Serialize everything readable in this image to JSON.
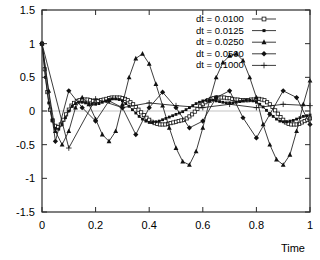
{
  "chart_data": {
    "type": "line",
    "title": "",
    "xlabel": "Time",
    "ylabel": "",
    "xlim": [
      0,
      1
    ],
    "ylim": [
      -1.5,
      1.5
    ],
    "grid": false,
    "legend_position": "top-right",
    "xticks": [
      "0",
      "0.2",
      "0.4",
      "0.6",
      "0.8",
      "1"
    ],
    "xtick_values": [
      0,
      0.2,
      0.4,
      0.6,
      0.8,
      1
    ],
    "yticks": [
      "1.5",
      "1",
      "0.5",
      "0",
      "-0.5",
      "-1",
      "-1.5"
    ],
    "ytick_values": [
      1.5,
      1,
      0.5,
      0,
      -0.5,
      -1,
      -1.5
    ],
    "series": [
      {
        "name": "dt = 0.0100",
        "marker": "open-square",
        "x": [
          0,
          0.01,
          0.02,
          0.03,
          0.04,
          0.05,
          0.06,
          0.07,
          0.08,
          0.09,
          0.1,
          0.11,
          0.12,
          0.13,
          0.14,
          0.15,
          0.16,
          0.17,
          0.18,
          0.19,
          0.2,
          0.21,
          0.22,
          0.23,
          0.24,
          0.25,
          0.26,
          0.27,
          0.28,
          0.29,
          0.3,
          0.31,
          0.32,
          0.33,
          0.34,
          0.35,
          0.36,
          0.37,
          0.38,
          0.39,
          0.4,
          0.41,
          0.42,
          0.43,
          0.44,
          0.45,
          0.46,
          0.47,
          0.48,
          0.49,
          0.5,
          0.51,
          0.52,
          0.53,
          0.54,
          0.55,
          0.56,
          0.57,
          0.58,
          0.59,
          0.6,
          0.61,
          0.62,
          0.63,
          0.64,
          0.65,
          0.66,
          0.67,
          0.68,
          0.69,
          0.7,
          0.71,
          0.72,
          0.73,
          0.74,
          0.75,
          0.76,
          0.77,
          0.78,
          0.79,
          0.8,
          0.81,
          0.82,
          0.83,
          0.84,
          0.85,
          0.86,
          0.87,
          0.88,
          0.89,
          0.9,
          0.91,
          0.92,
          0.93,
          0.94,
          0.95,
          0.96,
          0.97,
          0.98,
          0.99,
          1.0
        ],
        "y": [
          1.0,
          0.62,
          0.28,
          0.02,
          -0.14,
          -0.22,
          -0.24,
          -0.2,
          -0.13,
          -0.05,
          0.02,
          0.08,
          0.12,
          0.15,
          0.16,
          0.17,
          0.17,
          0.17,
          0.16,
          0.15,
          0.15,
          0.15,
          0.16,
          0.17,
          0.18,
          0.19,
          0.2,
          0.2,
          0.2,
          0.2,
          0.19,
          0.18,
          0.16,
          0.13,
          0.1,
          0.06,
          0.02,
          -0.02,
          -0.06,
          -0.1,
          -0.13,
          -0.16,
          -0.18,
          -0.19,
          -0.2,
          -0.2,
          -0.2,
          -0.19,
          -0.18,
          -0.17,
          -0.16,
          -0.15,
          -0.14,
          -0.13,
          -0.11,
          -0.08,
          -0.05,
          -0.01,
          0.03,
          0.07,
          0.1,
          0.13,
          0.16,
          0.18,
          0.19,
          0.2,
          0.2,
          0.2,
          0.2,
          0.19,
          0.19,
          0.18,
          0.17,
          0.17,
          0.16,
          0.16,
          0.16,
          0.16,
          0.17,
          0.17,
          0.18,
          0.18,
          0.17,
          0.16,
          0.13,
          0.1,
          0.06,
          0.01,
          -0.04,
          -0.09,
          -0.13,
          -0.17,
          -0.19,
          -0.2,
          -0.2,
          -0.2,
          -0.19,
          -0.17,
          -0.15,
          -0.13,
          -0.11
        ]
      },
      {
        "name": "dt = 0.0125",
        "marker": "filled-square",
        "x": [
          0,
          0.0125,
          0.025,
          0.0375,
          0.05,
          0.0625,
          0.075,
          0.0875,
          0.1,
          0.1125,
          0.125,
          0.1375,
          0.15,
          0.1625,
          0.175,
          0.1875,
          0.2,
          0.2125,
          0.225,
          0.2375,
          0.25,
          0.2625,
          0.275,
          0.2875,
          0.3,
          0.3125,
          0.325,
          0.3375,
          0.35,
          0.3625,
          0.375,
          0.3875,
          0.4,
          0.4125,
          0.425,
          0.4375,
          0.45,
          0.4625,
          0.475,
          0.4875,
          0.5,
          0.5125,
          0.525,
          0.5375,
          0.55,
          0.5625,
          0.575,
          0.5875,
          0.6,
          0.6125,
          0.625,
          0.6375,
          0.65,
          0.6625,
          0.675,
          0.6875,
          0.7,
          0.7125,
          0.725,
          0.7375,
          0.75,
          0.7625,
          0.775,
          0.7875,
          0.8,
          0.8125,
          0.825,
          0.8375,
          0.85,
          0.8625,
          0.875,
          0.8875,
          0.9,
          0.9125,
          0.925,
          0.9375,
          0.95,
          0.9625,
          0.975,
          0.9875,
          1.0
        ],
        "y": [
          1.0,
          0.5,
          0.12,
          -0.14,
          -0.26,
          -0.27,
          -0.2,
          -0.1,
          0.0,
          0.07,
          0.11,
          0.13,
          0.13,
          0.12,
          0.11,
          0.1,
          0.1,
          0.11,
          0.13,
          0.15,
          0.17,
          0.18,
          0.18,
          0.17,
          0.15,
          0.11,
          0.07,
          0.02,
          -0.03,
          -0.08,
          -0.12,
          -0.15,
          -0.17,
          -0.17,
          -0.16,
          -0.15,
          -0.13,
          -0.11,
          -0.09,
          -0.07,
          -0.05,
          -0.03,
          -0.01,
          0.02,
          0.05,
          0.08,
          0.11,
          0.13,
          0.15,
          0.16,
          0.16,
          0.16,
          0.15,
          0.14,
          0.13,
          0.12,
          0.12,
          0.12,
          0.13,
          0.14,
          0.15,
          0.16,
          0.16,
          0.15,
          0.13,
          0.1,
          0.06,
          0.01,
          -0.04,
          -0.08,
          -0.12,
          -0.15,
          -0.16,
          -0.16,
          -0.15,
          -0.14,
          -0.12,
          -0.1,
          -0.08,
          -0.07,
          -0.06
        ]
      },
      {
        "name": "dt = 0.0250",
        "marker": "filled-triangle",
        "x": [
          0,
          0.025,
          0.05,
          0.075,
          0.1,
          0.125,
          0.15,
          0.175,
          0.2,
          0.225,
          0.25,
          0.275,
          0.3,
          0.325,
          0.35,
          0.375,
          0.4,
          0.425,
          0.45,
          0.475,
          0.5,
          0.525,
          0.55,
          0.575,
          0.6,
          0.625,
          0.65,
          0.675,
          0.7,
          0.725,
          0.75,
          0.775,
          0.8,
          0.825,
          0.85,
          0.875,
          0.9,
          0.925,
          0.95,
          0.975,
          1.0
        ],
        "y": [
          1.0,
          0.3,
          -0.3,
          -0.5,
          -0.3,
          0.05,
          0.2,
          0.1,
          -0.12,
          -0.35,
          -0.45,
          -0.3,
          0.1,
          0.5,
          0.78,
          0.85,
          0.7,
          0.4,
          0.08,
          -0.25,
          -0.55,
          -0.75,
          -0.8,
          -0.6,
          -0.25,
          0.15,
          0.5,
          0.72,
          0.82,
          0.85,
          0.75,
          0.5,
          0.2,
          -0.2,
          -0.5,
          -0.72,
          -0.8,
          -0.65,
          -0.3,
          0.1,
          0.45
        ]
      },
      {
        "name": "dt = 0.0500",
        "marker": "filled-diamond",
        "x": [
          0,
          0.05,
          0.1,
          0.15,
          0.2,
          0.25,
          0.3,
          0.35,
          0.4,
          0.45,
          0.5,
          0.55,
          0.6,
          0.65,
          0.7,
          0.75,
          0.8,
          0.85,
          0.9,
          0.95,
          1.0
        ],
        "y": [
          1.0,
          -0.45,
          0.3,
          0.05,
          -0.15,
          0.15,
          0.05,
          -0.35,
          0.05,
          0.28,
          0.05,
          -0.25,
          -0.15,
          0.2,
          0.3,
          -0.1,
          -0.4,
          -0.05,
          0.3,
          0.2,
          -0.2
        ]
      },
      {
        "name": "dt = 0.1000",
        "marker": "plus",
        "x": [
          0,
          0.1,
          0.2,
          0.3,
          0.4,
          0.5,
          0.6,
          0.7,
          0.8,
          0.9,
          1.0
        ],
        "y": [
          1.0,
          -0.55,
          0.18,
          0.05,
          0.12,
          0.08,
          0.05,
          0.1,
          0.05,
          0.1,
          0.08
        ]
      }
    ]
  }
}
